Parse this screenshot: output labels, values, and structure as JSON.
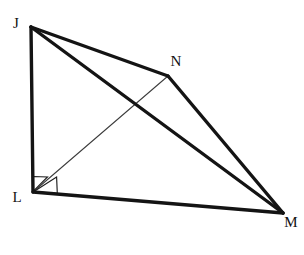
{
  "figure": {
    "background_color": "#ffffff",
    "stroke_color": "#141414",
    "thin_stroke_color": "#3c3c3c",
    "canvas": {
      "width": 304,
      "height": 255
    },
    "vertices": [
      {
        "id": "J",
        "label": "J",
        "x": 31,
        "y": 27,
        "label_x": 16,
        "label_y": 25
      },
      {
        "id": "N",
        "label": "N",
        "x": 168,
        "y": 76,
        "label_x": 176,
        "label_y": 63
      },
      {
        "id": "M",
        "label": "M",
        "x": 283,
        "y": 213,
        "label_x": 291,
        "label_y": 224
      },
      {
        "id": "L",
        "label": "L",
        "x": 33,
        "y": 192,
        "label_x": 17,
        "label_y": 199
      }
    ],
    "edges": [
      {
        "id": "JN",
        "from": "J",
        "to": "N",
        "weight": "thick",
        "label": "segment J to N"
      },
      {
        "id": "NM",
        "from": "N",
        "to": "M",
        "weight": "thick",
        "label": "segment N to M"
      },
      {
        "id": "ML",
        "from": "M",
        "to": "L",
        "weight": "thick",
        "label": "segment M to L"
      },
      {
        "id": "LJ",
        "from": "L",
        "to": "J",
        "weight": "thick",
        "label": "segment L to J"
      },
      {
        "id": "JM",
        "from": "J",
        "to": "M",
        "weight": "thick",
        "label": "diagonal J to M"
      },
      {
        "id": "LN",
        "from": "L",
        "to": "N",
        "weight": "thin",
        "label": "segment L to N"
      }
    ],
    "right_angle_marks": [
      {
        "id": "angle-JLN",
        "at": "L",
        "label": "right angle J-L-N",
        "size": 15
      },
      {
        "id": "angle-NLM",
        "at": "L",
        "label": "right angle N-L-M",
        "size": 15
      }
    ]
  }
}
